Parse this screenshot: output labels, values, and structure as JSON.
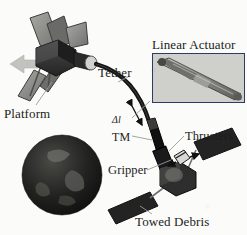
{
  "figure": {
    "domain": "diagram",
    "background_color": "#fbfbfa"
  },
  "labels": {
    "platform": "Platform",
    "tether": "Tether",
    "linear_actuator": "Linear Actuator",
    "delta_l": "Δl",
    "tm": "TM",
    "thrusters": "Thrusters",
    "gripper": "Gripper",
    "towed_debris": "Towed Debris"
  },
  "elements": {
    "chaser_satellite": {
      "name": "platform-spacecraft",
      "body_color": "#3a3a3a",
      "panel_color": "#8a8a88",
      "thrust_arrow_color": "#b9b9b7"
    },
    "earth": {
      "name": "earth-globe",
      "color": "#1e1e1e",
      "land_color": "#6e6e6a"
    },
    "tether_line": {
      "name": "tether-cable",
      "color": "#151515",
      "width_px": 4
    },
    "tm_module": {
      "name": "tether-management-module",
      "color": "#101010"
    },
    "debris": {
      "name": "towed-debris-satellite",
      "body_color": "#2b2b2b",
      "panel_color": "#202020"
    },
    "inset": {
      "name": "linear-actuator-inset",
      "border_color": "#2e3a66",
      "photo_color": "#b4b4b0"
    },
    "leader_line_color": "#9a9a98"
  }
}
